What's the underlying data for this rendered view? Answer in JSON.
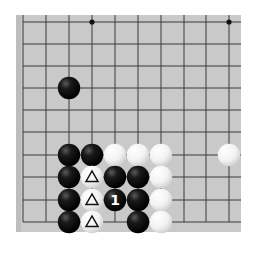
{
  "board": {
    "background": "#c9c9c9",
    "line_color": "#3a3a3a",
    "x_lines": [
      23,
      46,
      69,
      92,
      115,
      138,
      161,
      184,
      206,
      229
    ],
    "y_lines": [
      22,
      44,
      66,
      88,
      110,
      132,
      155,
      177,
      200,
      222
    ],
    "star_points": [
      [
        92,
        22
      ],
      [
        229,
        22
      ]
    ]
  },
  "stones": [
    {
      "color": "black",
      "x": 69,
      "y": 88
    },
    {
      "color": "black",
      "x": 69,
      "y": 155
    },
    {
      "color": "black",
      "x": 92,
      "y": 155
    },
    {
      "color": "white",
      "x": 115,
      "y": 155
    },
    {
      "color": "white",
      "x": 138,
      "y": 155
    },
    {
      "color": "white",
      "x": 161,
      "y": 155
    },
    {
      "color": "white",
      "x": 229,
      "y": 155
    },
    {
      "color": "black",
      "x": 69,
      "y": 177
    },
    {
      "color": "white",
      "x": 92,
      "y": 177,
      "mark": "triangle"
    },
    {
      "color": "black",
      "x": 115,
      "y": 177
    },
    {
      "color": "black",
      "x": 138,
      "y": 177
    },
    {
      "color": "white",
      "x": 161,
      "y": 177
    },
    {
      "color": "black",
      "x": 69,
      "y": 200
    },
    {
      "color": "white",
      "x": 92,
      "y": 200,
      "mark": "triangle"
    },
    {
      "color": "black",
      "x": 115,
      "y": 200,
      "label": "1"
    },
    {
      "color": "black",
      "x": 138,
      "y": 200
    },
    {
      "color": "white",
      "x": 161,
      "y": 200
    },
    {
      "color": "black",
      "x": 69,
      "y": 222
    },
    {
      "color": "white",
      "x": 92,
      "y": 222,
      "mark": "triangle"
    },
    {
      "color": "black",
      "x": 138,
      "y": 222
    },
    {
      "color": "white",
      "x": 161,
      "y": 222
    }
  ],
  "move_label": "1"
}
